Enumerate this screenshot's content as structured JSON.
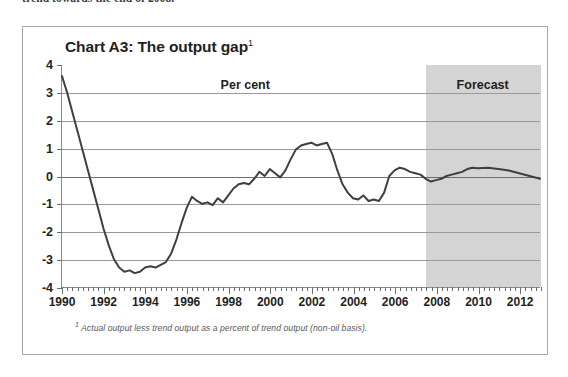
{
  "page": {
    "body_text_above": "trend towards the end of 2008."
  },
  "figure": {
    "title": "Chart A3: The output gap",
    "title_footnote_marker": "1",
    "footnote_marker": "1",
    "footnote": "Actual output less trend output as a percent of trend output (non-oil basis).",
    "frame_color": "#a6a6a6",
    "forecast_band_color": "#d4d4d4",
    "line_color": "#3f3f41",
    "gridline_color": "#9a9a9a"
  },
  "chart_data": {
    "type": "line",
    "title": "Chart A3: The output gap",
    "xlabel": "",
    "ylabel": "Per cent",
    "unit_label": "Per cent",
    "forecast_label": "Forecast",
    "forecast_start": 2007.5,
    "grid": true,
    "legend": "none",
    "xlim": [
      1990,
      2013
    ],
    "ylim": [
      -4,
      4
    ],
    "ytick_labels": [
      "4",
      "3",
      "2",
      "1",
      "0",
      "-1",
      "-2",
      "-3",
      "-4"
    ],
    "yticks": [
      4,
      3,
      2,
      1,
      0,
      -1,
      -2,
      -3,
      -4
    ],
    "xtick_labels": [
      "1990",
      "1992",
      "1994",
      "1996",
      "1998",
      "2000",
      "2002",
      "2004",
      "2006",
      "2008",
      "2010",
      "2012"
    ],
    "xticks": [
      1990,
      1992,
      1994,
      1996,
      1998,
      2000,
      2002,
      2004,
      2006,
      2008,
      2010,
      2012
    ],
    "minor_tick_interval": 0.25,
    "series": [
      {
        "name": "Output gap",
        "x": [
          1990.0,
          1990.25,
          1990.5,
          1990.75,
          1991.0,
          1991.25,
          1991.5,
          1991.75,
          1992.0,
          1992.25,
          1992.5,
          1992.75,
          1993.0,
          1993.25,
          1993.5,
          1993.75,
          1994.0,
          1994.25,
          1994.5,
          1994.75,
          1995.0,
          1995.25,
          1995.5,
          1995.75,
          1996.0,
          1996.25,
          1996.5,
          1996.75,
          1997.0,
          1997.25,
          1997.5,
          1997.75,
          1998.0,
          1998.25,
          1998.5,
          1998.75,
          1999.0,
          1999.25,
          1999.5,
          1999.75,
          2000.0,
          2000.25,
          2000.5,
          2000.75,
          2001.0,
          2001.25,
          2001.5,
          2001.75,
          2002.0,
          2002.25,
          2002.5,
          2002.75,
          2003.0,
          2003.25,
          2003.5,
          2003.75,
          2004.0,
          2004.25,
          2004.5,
          2004.75,
          2005.0,
          2005.25,
          2005.5,
          2005.75,
          2006.0,
          2006.25,
          2006.5,
          2006.75,
          2007.0,
          2007.25,
          2007.5,
          2007.75,
          2008.0,
          2008.25,
          2008.5,
          2008.75,
          2009.0,
          2009.25,
          2009.5,
          2009.75,
          2010.0,
          2010.5,
          2011.0,
          2011.5,
          2012.0,
          2012.5,
          2013.0
        ],
        "values": [
          3.6,
          3.0,
          2.3,
          1.6,
          0.9,
          0.2,
          -0.5,
          -1.2,
          -1.9,
          -2.5,
          -3.0,
          -3.3,
          -3.45,
          -3.4,
          -3.5,
          -3.45,
          -3.3,
          -3.25,
          -3.3,
          -3.2,
          -3.1,
          -2.8,
          -2.3,
          -1.7,
          -1.15,
          -0.75,
          -0.9,
          -1.0,
          -0.95,
          -1.05,
          -0.8,
          -0.95,
          -0.7,
          -0.45,
          -0.3,
          -0.25,
          -0.3,
          -0.1,
          0.15,
          0.0,
          0.25,
          0.1,
          -0.05,
          0.2,
          0.6,
          0.95,
          1.1,
          1.15,
          1.2,
          1.1,
          1.15,
          1.2,
          0.8,
          0.2,
          -0.3,
          -0.6,
          -0.8,
          -0.85,
          -0.7,
          -0.9,
          -0.85,
          -0.9,
          -0.6,
          0.0,
          0.2,
          0.3,
          0.25,
          0.15,
          0.1,
          0.05,
          -0.1,
          -0.2,
          -0.15,
          -0.1,
          0.0,
          0.05,
          0.1,
          0.15,
          0.25,
          0.3,
          0.28,
          0.3,
          0.25,
          0.2,
          0.1,
          0.0,
          -0.1
        ]
      }
    ],
    "annotations": [
      {
        "text": "Per cent",
        "x": 1998.8,
        "y": 3.55
      },
      {
        "text": "Forecast",
        "x": 2010.2,
        "y": 3.55
      }
    ]
  }
}
